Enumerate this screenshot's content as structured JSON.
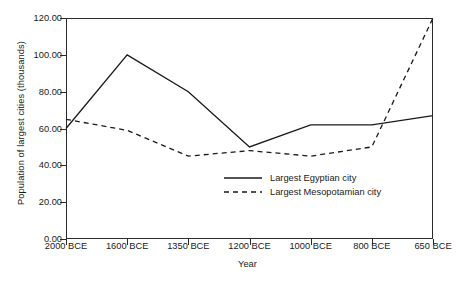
{
  "chart_data": {
    "type": "line",
    "title": "",
    "xlabel": "Year",
    "ylabel": "Population of largest cities (thousands)",
    "categories": [
      "2000 BCE",
      "1600 BCE",
      "1350 BCE",
      "1200 BCE",
      "1000 BCE",
      "800 BCE",
      "650 BCE"
    ],
    "series": [
      {
        "name": "Largest Egyptian city",
        "style": "solid",
        "color": "#1a1a1a",
        "values": [
          60,
          100,
          80,
          50,
          62,
          62,
          67
        ]
      },
      {
        "name": "Largest Mesopotamian city",
        "style": "dashed",
        "color": "#1a1a1a",
        "values": [
          65,
          59,
          45,
          48,
          45,
          50,
          120
        ]
      }
    ],
    "ylim": [
      0,
      120
    ],
    "ytick_values": [
      0,
      20,
      40,
      60,
      80,
      100,
      120
    ],
    "ytick_labels": [
      "0.00",
      "20.00",
      "40.00",
      "60.00",
      "80.00",
      "100.00",
      "120.00"
    ],
    "grid": false,
    "legend_position": "inside-bottom-center",
    "axis_color": "#2b2b2b",
    "background": "#ffffff"
  }
}
